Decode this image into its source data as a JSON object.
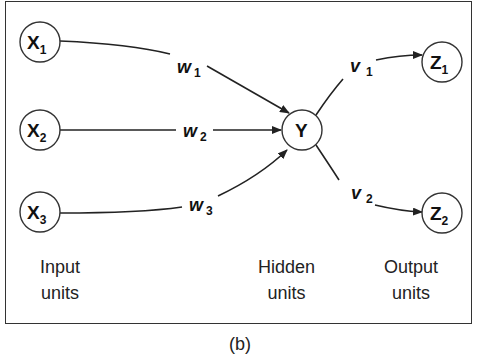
{
  "figure": {
    "caption": "(b)",
    "nodes": {
      "x1": {
        "label": "X",
        "sub": "1"
      },
      "x2": {
        "label": "X",
        "sub": "2"
      },
      "x3": {
        "label": "X",
        "sub": "3"
      },
      "y": {
        "label": "Y"
      },
      "z1": {
        "label": "Z",
        "sub": "1"
      },
      "z2": {
        "label": "Z",
        "sub": "2"
      }
    },
    "weights": {
      "w1": {
        "label": "w",
        "sub": "1"
      },
      "w2": {
        "label": "w",
        "sub": "2"
      },
      "w3": {
        "label": "w",
        "sub": "3"
      },
      "v1": {
        "label": "v",
        "sub": "1"
      },
      "v2": {
        "label": "v",
        "sub": "2"
      }
    },
    "layers": {
      "input": {
        "line1": "Input",
        "line2": "units"
      },
      "hidden": {
        "line1": "Hidden",
        "line2": "units"
      },
      "output": {
        "line1": "Output",
        "line2": "units"
      }
    }
  }
}
